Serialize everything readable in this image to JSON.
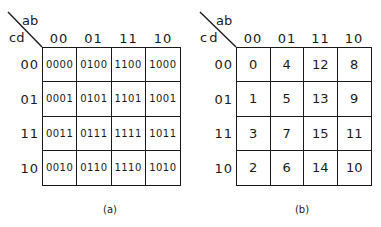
{
  "maps": [
    {
      "id": "a",
      "caption": "(a)",
      "corner": {
        "col_var": "ab",
        "row_var": "cd"
      },
      "col_headers": [
        "00",
        "01",
        "11",
        "10"
      ],
      "row_headers": [
        "00",
        "01",
        "11",
        "10"
      ],
      "cells": [
        [
          "0000",
          "0100",
          "1100",
          "1000"
        ],
        [
          "0001",
          "0101",
          "1101",
          "1001"
        ],
        [
          "0011",
          "0111",
          "1111",
          "1011"
        ],
        [
          "0010",
          "0110",
          "1110",
          "1010"
        ]
      ]
    },
    {
      "id": "b",
      "caption": "(b)",
      "corner": {
        "col_var": "ab",
        "row_var": "cd"
      },
      "col_headers": [
        "00",
        "01",
        "11",
        "10"
      ],
      "row_headers": [
        "00",
        "01",
        "11",
        "10"
      ],
      "cells": [
        [
          "0",
          "4",
          "12",
          "8"
        ],
        [
          "1",
          "5",
          "13",
          "9"
        ],
        [
          "3",
          "7",
          "15",
          "11"
        ],
        [
          "2",
          "6",
          "14",
          "10"
        ]
      ]
    }
  ]
}
